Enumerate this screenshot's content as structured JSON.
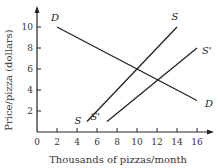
{
  "chart_data": {
    "type": "line",
    "title": "",
    "xlabel": "Thousands of pizzas/month",
    "ylabel": "Price/pizza (dollars)",
    "xlim": [
      0,
      17
    ],
    "ylim": [
      0,
      11
    ],
    "x_ticks": [
      0,
      2,
      4,
      6,
      8,
      10,
      12,
      14,
      16
    ],
    "y_ticks": [
      2,
      4,
      6,
      8,
      10
    ],
    "grid": false,
    "legend": "inline labels",
    "series": [
      {
        "name": "D",
        "points": [
          [
            2,
            10
          ],
          [
            16,
            3
          ]
        ],
        "label_start": "D",
        "label_end": "D"
      },
      {
        "name": "S",
        "points": [
          [
            5,
            1
          ],
          [
            14,
            10
          ]
        ],
        "label_start": "S",
        "label_end": "S"
      },
      {
        "name": "S'",
        "points": [
          [
            7,
            1
          ],
          [
            16,
            8
          ]
        ],
        "label_start": "S'",
        "label_end": "S'"
      }
    ]
  }
}
